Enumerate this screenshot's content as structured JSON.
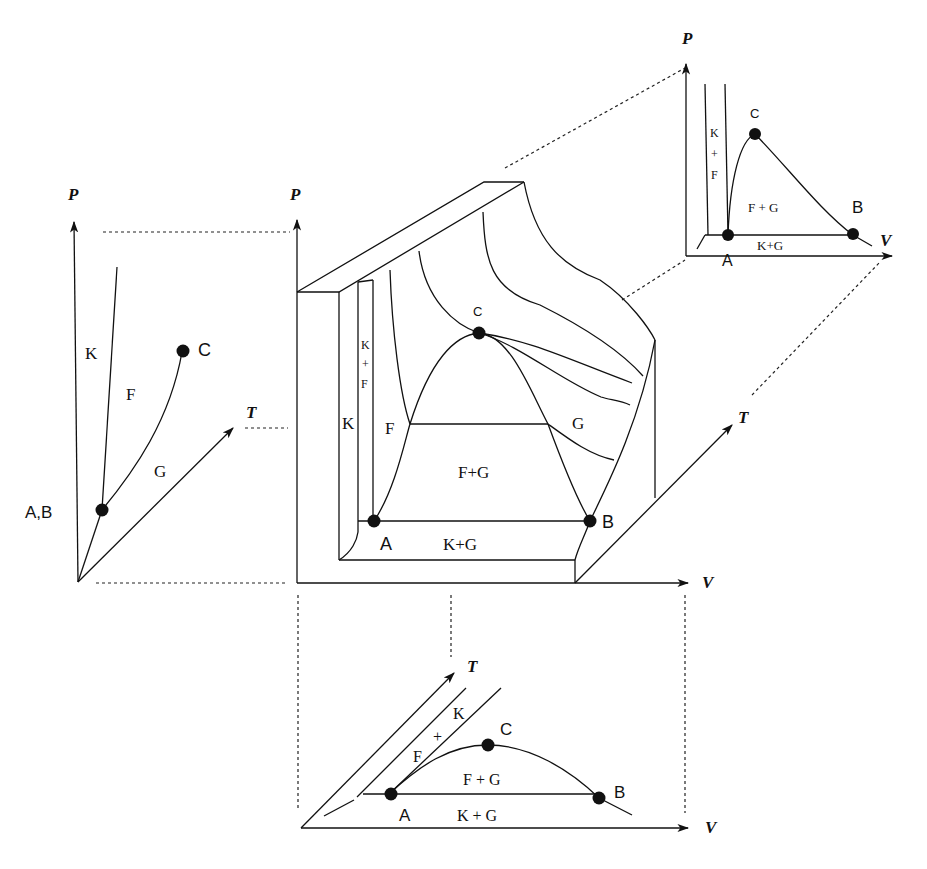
{
  "diagram": {
    "title": "",
    "panels": {
      "pt": {
        "name": "P-T projection",
        "axes": {
          "y": "P",
          "x": "T"
        },
        "regions": {
          "solid": "K",
          "liquid": "F",
          "gas": "G"
        },
        "points": {
          "triple": "A,B",
          "critical": "C"
        }
      },
      "pvt": {
        "name": "P-V-T surface",
        "axes": {
          "y": "P",
          "x": "V",
          "z": "T"
        },
        "regions": {
          "solid": "K",
          "solid_liquid_k": "K",
          "solid_liquid_plus": "+",
          "solid_liquid_f": "F",
          "liquid": "F",
          "gas": "G",
          "liquid_gas": "F+G",
          "solid_gas": "K+G"
        },
        "points": {
          "a": "A",
          "b": "B",
          "critical": "C"
        }
      },
      "pv": {
        "name": "P-V projection",
        "axes": {
          "y": "P",
          "x": "V"
        },
        "regions": {
          "solid_liquid_k": "K",
          "solid_liquid_plus": "+",
          "solid_liquid_f": "F",
          "liquid_gas": "F + G",
          "solid_gas": "K+G"
        },
        "points": {
          "a": "A",
          "b": "B",
          "critical": "C"
        }
      },
      "tv": {
        "name": "T-V projection",
        "axes": {
          "y": "T",
          "x": "V"
        },
        "regions": {
          "solid_liquid_k": "K",
          "solid_liquid_plus": "+",
          "solid_liquid_f": "F",
          "liquid_gas": "F + G",
          "solid_gas": "K + G"
        },
        "points": {
          "a": "A",
          "b": "B",
          "critical": "C"
        }
      }
    },
    "colors": {
      "ink": "#111111",
      "background": "#ffffff"
    }
  }
}
